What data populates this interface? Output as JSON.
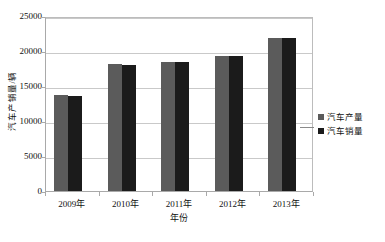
{
  "chart_data": {
    "type": "bar",
    "title": "",
    "xlabel": "年份",
    "ylabel": "汽车产销量/辆",
    "categories": [
      "2009年",
      "2010年",
      "2011年",
      "2012年",
      "2013年"
    ],
    "series": [
      {
        "name": "汽车产量",
        "color": "#5b5b5b",
        "values": [
          13700,
          18200,
          18400,
          19300,
          21800
        ]
      },
      {
        "name": "汽车销量",
        "color": "#1b1b1b",
        "values": [
          13600,
          18000,
          18500,
          19300,
          21900
        ]
      }
    ],
    "ylim": [
      0,
      25000
    ],
    "yticks": [
      0,
      5000,
      10000,
      15000,
      20000,
      25000
    ],
    "ytick_labels": [
      "0",
      "5000",
      "10000",
      "15000",
      "20000",
      "25000"
    ],
    "grid": true,
    "legend_position": "right"
  },
  "axes": {
    "y_title": "汽车产销量/辆",
    "x_title": "年份"
  },
  "legend": {
    "items": [
      {
        "label": "汽车产量",
        "color": "#5b5b5b"
      },
      {
        "label": "汽车销量",
        "color": "#1b1b1b"
      }
    ]
  },
  "top_caption": ""
}
